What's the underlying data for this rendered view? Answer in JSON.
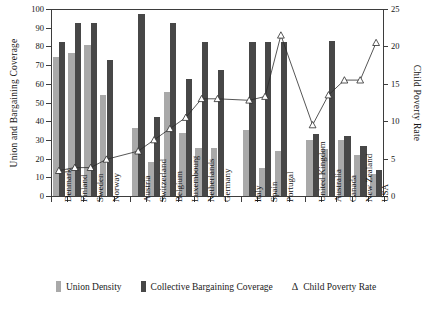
{
  "chart_data": {
    "type": "bar",
    "title": "",
    "xlabel": "",
    "ylabel": "Union and Bargaining Coverage",
    "y2label": "Child Poverty Rate",
    "ylim": [
      0,
      100
    ],
    "y2lim": [
      0,
      25
    ],
    "yticks": [
      0,
      10,
      20,
      30,
      40,
      50,
      60,
      70,
      80,
      90,
      100
    ],
    "y2ticks": [
      0,
      5,
      10,
      15,
      20,
      25
    ],
    "grid": false,
    "legend_position": "bottom",
    "categories": [
      "Denmark",
      "Finland",
      "Sweden",
      "Norway",
      "Austria",
      "Switzerland",
      "Belgium",
      "Luxembourg",
      "Netherlands",
      "Germany",
      "Italy",
      "Spain",
      "Portugal",
      "United Kingdom",
      "Australia",
      "Canada",
      "New Zealand",
      "USA"
    ],
    "group_breaks": [
      4,
      10,
      13
    ],
    "series": [
      {
        "name": "Union Density",
        "axis": "left",
        "color": "#a9a9a9",
        "values": [
          74.5,
          76.5,
          81,
          54,
          36.5,
          18,
          55.5,
          33.5,
          25.5,
          25.5,
          35.5,
          15,
          24,
          30,
          25,
          30,
          22,
          12
        ]
      },
      {
        "name": "Collective Bargaining Coverage",
        "axis": "left",
        "color": "#474747",
        "values": [
          82.5,
          92.5,
          92.5,
          72.5,
          97.5,
          42.5,
          92.5,
          62.5,
          82.5,
          67.5,
          82.5,
          82.5,
          82.5,
          33,
          83,
          32,
          27,
          14
        ]
      },
      {
        "name": "Child Poverty Rate",
        "axis": "right",
        "marker": "triangle",
        "color": "#2b2b2b",
        "values": [
          3.4,
          3.8,
          3.8,
          4.9,
          6.0,
          7.5,
          9.0,
          10.5,
          13.0,
          13.0,
          12.8,
          13.3,
          21.5,
          9.5,
          13.5,
          15.5,
          15.5,
          20.5
        ]
      }
    ]
  },
  "axes": {
    "left": {
      "title": "Union and Bargaining Coverage",
      "labels": [
        "100",
        "90",
        "80",
        "70",
        "60",
        "50",
        "40",
        "30",
        "20",
        "10",
        "0"
      ]
    },
    "right": {
      "title": "Child Poverty Rate",
      "labels": [
        "25",
        "20",
        "15",
        "10",
        "5",
        "0"
      ]
    }
  },
  "legend": {
    "items": [
      {
        "label": "Union Density",
        "marker": "square",
        "color": "#a9a9a9"
      },
      {
        "label": "Collective Bargaining Coverage",
        "marker": "square",
        "color": "#474747"
      },
      {
        "label": "Child Poverty Rate",
        "marker": "triangle",
        "glyph": "Δ"
      }
    ]
  }
}
